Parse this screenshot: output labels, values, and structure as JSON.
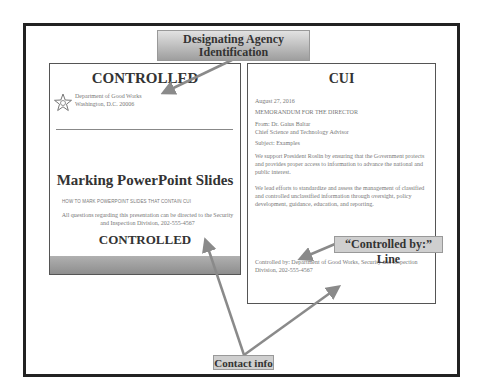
{
  "callouts": {
    "agency_line1": "Designating Agency",
    "agency_line2": "Identification",
    "controlled_by": "“Controlled by:” Line",
    "contact": "Contact info"
  },
  "left_slide": {
    "header_banner": "CONTROLLED",
    "agency_name": "Department of Good Works",
    "agency_address": "Washington, D.C. 20006",
    "title": "Marking PowerPoint Slides",
    "subtitle": "HOW TO MARK POWERPOINT SLIDES THAT CONTAIN CUI",
    "contact_text": "All questions regarding this presentation can be directed to the Security and Inspection Division, 202-555-4567",
    "footer_banner": "CONTROLLED",
    "logo_icon": "star-seal-icon"
  },
  "right_slide": {
    "banner": "CUI",
    "date": "August 27, 2016",
    "memo_line": "MEMORANDUM FOR THE DIRECTOR",
    "from": "From:  Dr. Gaius Baltar",
    "from_title": "Chief Science and Technology Advisor",
    "subject": "Subject:  Examples",
    "para1": "We support President Roslin by ensuring that the Government protects and provides proper access to information to advance the national and public interest.",
    "para2": "We lead efforts to standardize and assess the management of classified and controlled unclassified information through oversight, policy development, guidance, education, and reporting.",
    "controlled_by": "Controlled by: Department of Good Works, Security and Inspection Division, 202-555-4567"
  },
  "colors": {
    "frame": "#222222",
    "arrow": "#8a8a8a",
    "callout_fill": "#cfcfcf",
    "footer_band": "#9a9a9a"
  }
}
